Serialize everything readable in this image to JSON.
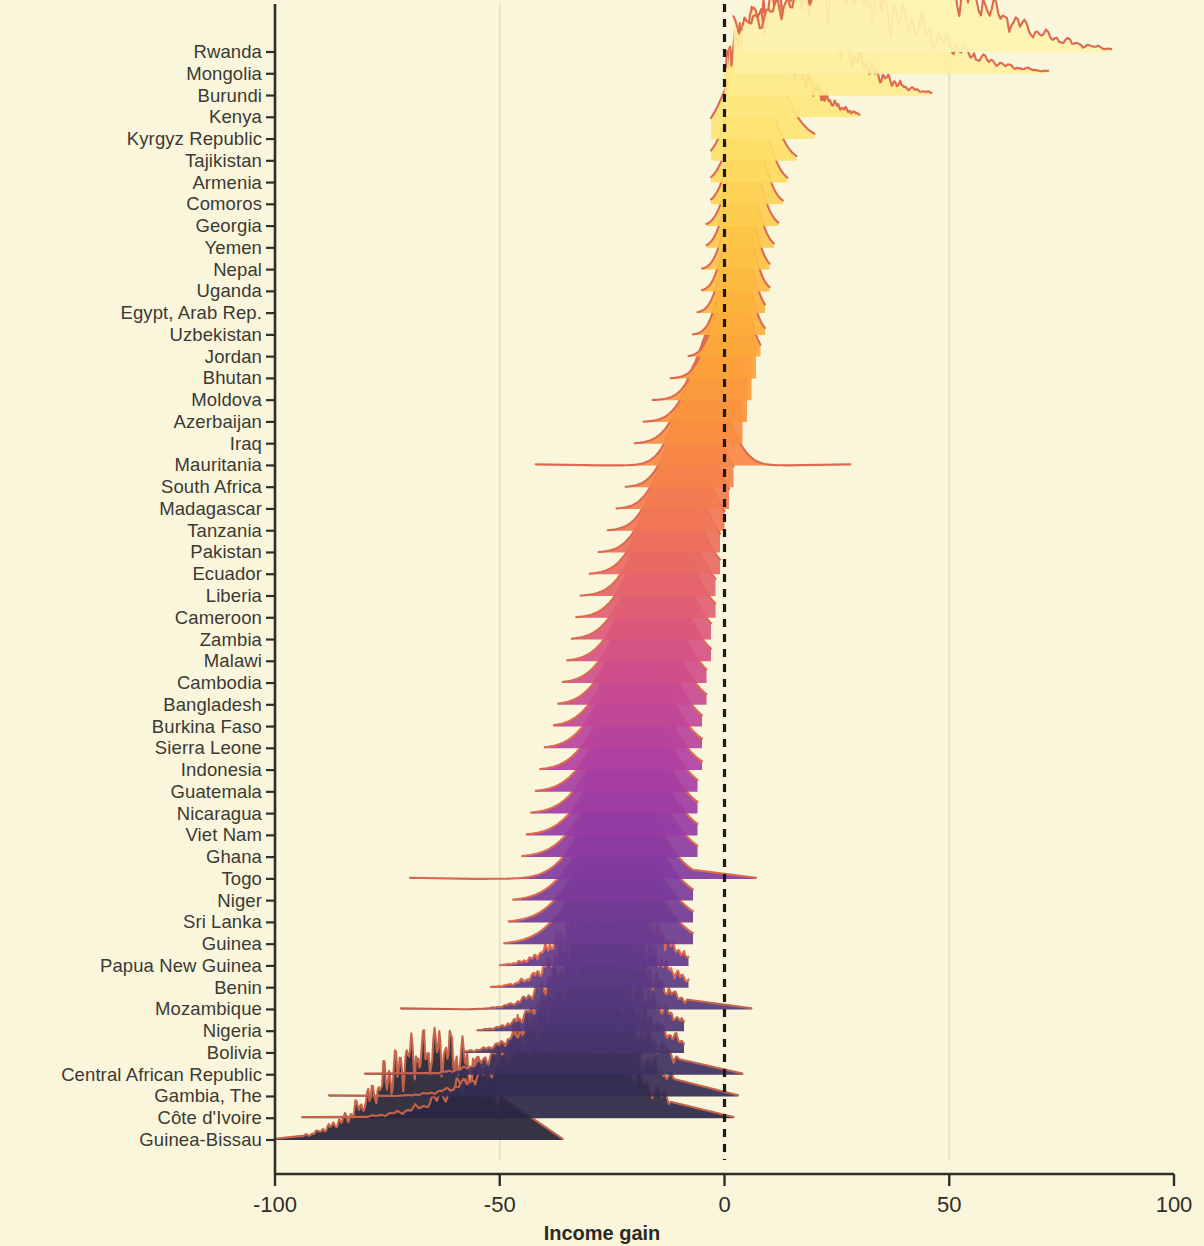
{
  "chart_data": {
    "type": "area",
    "title": "",
    "xlabel": "Income gain",
    "ylabel": "",
    "xlim": [
      -100,
      100
    ],
    "xticks": [
      -100,
      -50,
      0,
      50,
      100
    ],
    "xtick_labels": [
      "-100",
      "-50",
      "0",
      "50",
      "100"
    ],
    "grid": "faint vertical gridlines at -50 and 50",
    "legend": "none",
    "annotations": [
      {
        "type": "reference-line",
        "orientation": "vertical",
        "value": 0,
        "style": "dashed",
        "color": "#1a1a1a"
      }
    ],
    "colormap": "magma-like: pale yellow (top) -> orange -> red -> purple -> near black (bottom)",
    "categories": [
      "Rwanda",
      "Mongolia",
      "Burundi",
      "Kenya",
      "Kyrgyz Republic",
      "Tajikistan",
      "Armenia",
      "Comoros",
      "Georgia",
      "Yemen",
      "Nepal",
      "Uganda",
      "Egypt, Arab Rep.",
      "Uzbekistan",
      "Jordan",
      "Bhutan",
      "Moldova",
      "Azerbaijan",
      "Iraq",
      "Mauritania",
      "South Africa",
      "Madagascar",
      "Tanzania",
      "Pakistan",
      "Ecuador",
      "Liberia",
      "Cameroon",
      "Zambia",
      "Malawi",
      "Cambodia",
      "Bangladesh",
      "Burkina Faso",
      "Sierra Leone",
      "Indonesia",
      "Guatemala",
      "Nicaragua",
      "Viet Nam",
      "Ghana",
      "Togo",
      "Niger",
      "Sri Lanka",
      "Guinea",
      "Papua New Guinea",
      "Benin",
      "Mozambique",
      "Nigeria",
      "Bolivia",
      "Central African Republic",
      "Gambia, The",
      "Côte d'Ivoire",
      "Guinea-Bissau"
    ],
    "series": [
      {
        "name": "Rwanda",
        "fill": "#fdf3b0",
        "line": "#e06a52",
        "mode": 44,
        "spread": 22,
        "skew": -0.35,
        "peak": 1.0,
        "xmin": 4,
        "xmax": 86,
        "bumpy": true
      },
      {
        "name": "Mongolia",
        "fill": "#fdf0a2",
        "line": "#e06a52",
        "mode": 30,
        "spread": 20,
        "skew": -0.3,
        "peak": 0.95,
        "xmin": 2,
        "xmax": 72,
        "bumpy": true
      },
      {
        "name": "Burundi",
        "fill": "#fdeb8e",
        "line": "#e06a52",
        "mode": 17,
        "spread": 13,
        "skew": -0.2,
        "peak": 0.92,
        "xmin": 1,
        "xmax": 46,
        "bumpy": true
      },
      {
        "name": "Kenya",
        "fill": "#fde87f",
        "line": "#e06a52",
        "mode": 9,
        "spread": 9,
        "skew": -0.1,
        "peak": 0.9,
        "xmin": 0,
        "xmax": 30,
        "bumpy": true
      },
      {
        "name": "Kyrgyz Republic",
        "fill": "#fde473",
        "line": "#e0684f",
        "mode": 6,
        "spread": 5.5,
        "skew": 0.1,
        "peak": 0.88,
        "xmin": -3,
        "xmax": 20,
        "bumpy": false
      },
      {
        "name": "Tajikistan",
        "fill": "#fddf68",
        "line": "#e0664d",
        "mode": 5,
        "spread": 4.2,
        "skew": 0.15,
        "peak": 0.87,
        "xmin": -3,
        "xmax": 16,
        "bumpy": false
      },
      {
        "name": "Armenia",
        "fill": "#fdd95f",
        "line": "#e0644b",
        "mode": 4.5,
        "spread": 3.6,
        "skew": 0.2,
        "peak": 0.86,
        "xmin": -3,
        "xmax": 14,
        "bumpy": false
      },
      {
        "name": "Comoros",
        "fill": "#fdd357",
        "line": "#e06249",
        "mode": 4,
        "spread": 3.3,
        "skew": 0.2,
        "peak": 0.85,
        "xmin": -3,
        "xmax": 13,
        "bumpy": false
      },
      {
        "name": "Georgia",
        "fill": "#fdcd50",
        "line": "#e06047",
        "mode": 3.5,
        "spread": 3.1,
        "skew": 0.2,
        "peak": 0.84,
        "xmin": -4,
        "xmax": 12,
        "bumpy": false
      },
      {
        "name": "Yemen",
        "fill": "#fdc74a",
        "line": "#df5e46",
        "mode": 3,
        "spread": 3.0,
        "skew": 0.2,
        "peak": 0.83,
        "xmin": -4,
        "xmax": 11,
        "bumpy": false
      },
      {
        "name": "Nepal",
        "fill": "#fdc145",
        "line": "#df5c44",
        "mode": 2.6,
        "spread": 2.9,
        "skew": 0.22,
        "peak": 0.82,
        "xmin": -5,
        "xmax": 10,
        "bumpy": false
      },
      {
        "name": "Uganda",
        "fill": "#fdbb41",
        "line": "#df5a43",
        "mode": 2.2,
        "spread": 2.9,
        "skew": 0.25,
        "peak": 0.82,
        "xmin": -5,
        "xmax": 10,
        "bumpy": false
      },
      {
        "name": "Egypt, Arab Rep.",
        "fill": "#fdb43e",
        "line": "#de5841",
        "mode": 1.8,
        "spread": 3.0,
        "skew": 0.25,
        "peak": 0.82,
        "xmin": -6,
        "xmax": 9,
        "bumpy": false
      },
      {
        "name": "Uzbekistan",
        "fill": "#fdae3c",
        "line": "#de5640",
        "mode": 1.2,
        "spread": 3.1,
        "skew": 0.3,
        "peak": 0.82,
        "xmin": -7,
        "xmax": 9,
        "bumpy": false
      },
      {
        "name": "Jordan",
        "fill": "#fca73b",
        "line": "#de543e",
        "mode": 0.5,
        "spread": 3.3,
        "skew": 0.3,
        "peak": 0.82,
        "xmin": -8,
        "xmax": 8,
        "bumpy": false
      },
      {
        "name": "Bhutan",
        "fill": "#fca13b",
        "line": "#dd523d",
        "mode": -0.6,
        "spread": 4.2,
        "skew": 0.35,
        "peak": 0.84,
        "xmin": -12,
        "xmax": 7,
        "bumpy": false
      },
      {
        "name": "Moldova",
        "fill": "#fb9a3c",
        "line": "#dd503c",
        "mode": -2.0,
        "spread": 5.0,
        "skew": 0.35,
        "peak": 0.86,
        "xmin": -16,
        "xmax": 6,
        "bumpy": false
      },
      {
        "name": "Azerbaijan",
        "fill": "#fa943e",
        "line": "#dc4e3b",
        "mode": -3.5,
        "spread": 5.4,
        "skew": 0.35,
        "peak": 0.86,
        "xmin": -18,
        "xmax": 5,
        "bumpy": false
      },
      {
        "name": "Iraq",
        "fill": "#f98e41",
        "line": "#dc4c3a",
        "mode": -5.0,
        "spread": 5.6,
        "skew": 0.3,
        "peak": 0.86,
        "xmin": -20,
        "xmax": 4,
        "bumpy": false
      },
      {
        "name": "Mauritania",
        "fill": "#f78845",
        "line": "#db4a39",
        "mode": -6.5,
        "spread": 5.0,
        "skew": 0.25,
        "peak": 0.92,
        "xmin": -28,
        "xmax": 14,
        "bumpy": false,
        "flat_tails": true
      },
      {
        "name": "South Africa",
        "fill": "#f5824a",
        "line": "#da4839",
        "mode": -8.0,
        "spread": 5.0,
        "skew": 0.25,
        "peak": 0.86,
        "xmin": -22,
        "xmax": 2,
        "bumpy": false
      },
      {
        "name": "Madagascar",
        "fill": "#f37c50",
        "line": "#d94638",
        "mode": -9.5,
        "spread": 5.2,
        "skew": 0.25,
        "peak": 0.86,
        "xmin": -24,
        "xmax": 1,
        "bumpy": false
      },
      {
        "name": "Tanzania",
        "fill": "#f07656",
        "line": "#d84438",
        "mode": -11.0,
        "spread": 5.4,
        "skew": 0.25,
        "peak": 0.86,
        "xmin": -26,
        "xmax": 0,
        "bumpy": false
      },
      {
        "name": "Pakistan",
        "fill": "#ed705d",
        "line": "#d74238",
        "mode": -12.5,
        "spread": 5.6,
        "skew": 0.25,
        "peak": 0.86,
        "xmin": -28,
        "xmax": -1,
        "bumpy": false
      },
      {
        "name": "Ecuador",
        "fill": "#e96a64",
        "line": "#d54038",
        "mode": -13.5,
        "spread": 5.8,
        "skew": 0.2,
        "peak": 0.86,
        "xmin": -30,
        "xmax": -1,
        "bumpy": false
      },
      {
        "name": "Liberia",
        "fill": "#e5646b",
        "line": "#d33e38",
        "mode": -14.5,
        "spread": 6.0,
        "skew": 0.2,
        "peak": 0.86,
        "xmin": -32,
        "xmax": -2,
        "bumpy": false
      },
      {
        "name": "Cameroon",
        "fill": "#e05e73",
        "line": "#d13c38",
        "mode": -15.5,
        "spread": 6.2,
        "skew": 0.2,
        "peak": 0.86,
        "xmin": -33,
        "xmax": -2,
        "bumpy": false
      },
      {
        "name": "Zambia",
        "fill": "#db587b",
        "line": "#ce3b38",
        "mode": -16.5,
        "spread": 6.4,
        "skew": 0.2,
        "peak": 0.86,
        "xmin": -34,
        "xmax": -3,
        "bumpy": false
      },
      {
        "name": "Malawi",
        "fill": "#d55383",
        "line": "#cb3a38",
        "mode": -17.5,
        "spread": 6.5,
        "skew": 0.2,
        "peak": 0.86,
        "xmin": -35,
        "xmax": -3,
        "bumpy": false
      },
      {
        "name": "Cambodia",
        "fill": "#cf4e8a",
        "line": "#c73939",
        "mode": -18.5,
        "spread": 6.6,
        "skew": 0.2,
        "peak": 0.86,
        "xmin": -36,
        "xmax": -4,
        "bumpy": false
      },
      {
        "name": "Bangladesh",
        "fill": "#c84a91",
        "line": "#c33839",
        "mode": -19.5,
        "spread": 6.7,
        "skew": 0.2,
        "peak": 0.86,
        "xmin": -37,
        "xmax": -4,
        "bumpy": false
      },
      {
        "name": "Burkina Faso",
        "fill": "#c04697",
        "line": "#be383a",
        "mode": -20.5,
        "spread": 6.8,
        "skew": 0.2,
        "peak": 0.86,
        "xmin": -38,
        "xmax": -5,
        "bumpy": false
      },
      {
        "name": "Sierra Leone",
        "fill": "#b8439c",
        "line": "#b9373a",
        "mode": -21.5,
        "spread": 7.0,
        "skew": 0.2,
        "peak": 0.86,
        "xmin": -40,
        "xmax": -5,
        "bumpy": false
      },
      {
        "name": "Indonesia",
        "fill": "#b040a0",
        "line": "#b4373b",
        "mode": -22.0,
        "spread": 7.1,
        "skew": 0.2,
        "peak": 0.86,
        "xmin": -41,
        "xmax": -5,
        "bumpy": false
      },
      {
        "name": "Guatemala",
        "fill": "#a73ea2",
        "line": "#ae363b",
        "mode": -22.5,
        "spread": 7.3,
        "skew": 0.2,
        "peak": 0.86,
        "xmin": -42,
        "xmax": -6,
        "bumpy": false
      },
      {
        "name": "Nicaragua",
        "fill": "#9e3da3",
        "line": "#a8363c",
        "mode": -23.0,
        "spread": 7.5,
        "skew": 0.2,
        "peak": 0.86,
        "xmin": -43,
        "xmax": -6,
        "bumpy": false
      },
      {
        "name": "Viet Nam",
        "fill": "#953ca3",
        "line": "#a2353c",
        "mode": -23.5,
        "spread": 7.7,
        "skew": 0.2,
        "peak": 0.86,
        "xmin": -44,
        "xmax": -6,
        "bumpy": false
      },
      {
        "name": "Ghana",
        "fill": "#8c3ba1",
        "line": "#9c353d",
        "mode": -24.0,
        "spread": 7.9,
        "skew": 0.2,
        "peak": 0.86,
        "xmin": -45,
        "xmax": -6,
        "bumpy": false
      },
      {
        "name": "Togo",
        "fill": "#833b9e",
        "line": "#96343d",
        "mode": -25.0,
        "spread": 7.5,
        "skew": 0.2,
        "peak": 0.9,
        "xmin": -56,
        "xmax": -7,
        "bumpy": false,
        "flat_tails": true
      },
      {
        "name": "Niger",
        "fill": "#7a3b9a",
        "line": "#90343e",
        "mode": -25.5,
        "spread": 8.1,
        "skew": 0.2,
        "peak": 0.86,
        "xmin": -47,
        "xmax": -7,
        "bumpy": false
      },
      {
        "name": "Sri Lanka",
        "fill": "#723b95",
        "line": "#8a333e",
        "mode": -26.0,
        "spread": 8.3,
        "skew": 0.2,
        "peak": 0.86,
        "xmin": -48,
        "xmax": -7,
        "bumpy": false
      },
      {
        "name": "Guinea",
        "fill": "#6a3b90",
        "line": "#84333e",
        "mode": -26.5,
        "spread": 8.5,
        "skew": 0.2,
        "peak": 0.86,
        "xmin": -49,
        "xmax": -7,
        "bumpy": false
      },
      {
        "name": "Papua New Guinea",
        "fill": "#623a8a",
        "line": "#7e323f",
        "mode": -27.5,
        "spread": 8.5,
        "skew": 0.2,
        "peak": 0.86,
        "xmin": -50,
        "xmax": -8,
        "bumpy": true
      },
      {
        "name": "Benin",
        "fill": "#5b3983",
        "line": "#78323f",
        "mode": -28.5,
        "spread": 8.8,
        "skew": 0.2,
        "peak": 0.86,
        "xmin": -52,
        "xmax": -8,
        "bumpy": true
      },
      {
        "name": "Mozambique",
        "fill": "#54387c",
        "line": "#72313f",
        "mode": -29.5,
        "spread": 9.2,
        "skew": 0.2,
        "peak": 0.88,
        "xmin": -58,
        "xmax": -8,
        "bumpy": true,
        "flat_tails": true
      },
      {
        "name": "Nigeria",
        "fill": "#4d3674",
        "line": "#6c3140",
        "mode": -30.5,
        "spread": 9.5,
        "skew": 0.2,
        "peak": 0.86,
        "xmin": -55,
        "xmax": -9,
        "bumpy": true
      },
      {
        "name": "Bolivia",
        "fill": "#46346b",
        "line": "#663040",
        "mode": -32.0,
        "spread": 10.5,
        "skew": 0.2,
        "peak": 0.86,
        "xmin": -58,
        "xmax": -9,
        "bumpy": true
      },
      {
        "name": "Central African Republic",
        "fill": "#3d3160",
        "line": "#603040",
        "mode": -34.0,
        "spread": 12.0,
        "skew": 0.15,
        "peak": 0.88,
        "xmin": -66,
        "xmax": -10,
        "bumpy": true,
        "flat_tails": true
      },
      {
        "name": "Gambia, The",
        "fill": "#342c53",
        "line": "#5a2f40",
        "mode": -36.0,
        "spread": 13.0,
        "skew": 0.15,
        "peak": 0.9,
        "xmin": -74,
        "xmax": -11,
        "bumpy": true,
        "flat_tails": true
      },
      {
        "name": "Côte d'Ivoire",
        "fill": "#2b2744",
        "line": "#552e40",
        "mode": -40.0,
        "spread": 15.0,
        "skew": 0.1,
        "peak": 0.92,
        "xmin": -80,
        "xmax": -12,
        "bumpy": true,
        "flat_tails": true
      },
      {
        "name": "Guinea-Bissau",
        "fill": "#262235",
        "line": "#d96a4e",
        "mode": -66.0,
        "spread": 12.0,
        "skew": 0.1,
        "peak": 0.95,
        "xmin": -94,
        "xmax": -50,
        "bumpy": true,
        "flat_tails": true
      }
    ]
  },
  "axes": {
    "x_title": "Income gain",
    "x_tick_labels": [
      "-100",
      "-50",
      "0",
      "50",
      "100"
    ],
    "zero_line_label": "0",
    "background_color": "#faf6dc",
    "axis_color": "#2f2e2a",
    "text_color": "#3b3a35"
  }
}
